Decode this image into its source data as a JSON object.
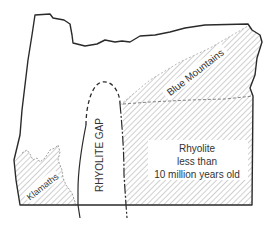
{
  "map": {
    "subject": "Oregon rhyolite distribution",
    "colors": {
      "outline": "#2a2a2a",
      "hatch": "#8a8a8a",
      "text": "#333333",
      "background": "#ffffff"
    },
    "regions": [
      {
        "id": "blue-mountains",
        "label": "Blue Mountains",
        "fill": "hatched"
      },
      {
        "id": "rhyolite-young",
        "label_lines": [
          "Rhyolite",
          "less than",
          "10 million years old"
        ],
        "fill": "hatched"
      },
      {
        "id": "rhyolite-gap",
        "label": "RHYOLITE GAP",
        "fill": "none"
      },
      {
        "id": "klamaths",
        "label": "Klamaths",
        "fill": "hatched"
      }
    ]
  },
  "labels": {
    "blue_mountains": "Blue Mountains",
    "rhyolite_line1": "Rhyolite",
    "rhyolite_line2": "less than",
    "rhyolite_line3": "10 million years old",
    "rhyolite_gap": "RHYOLITE GAP",
    "klamaths": "Klamaths"
  }
}
